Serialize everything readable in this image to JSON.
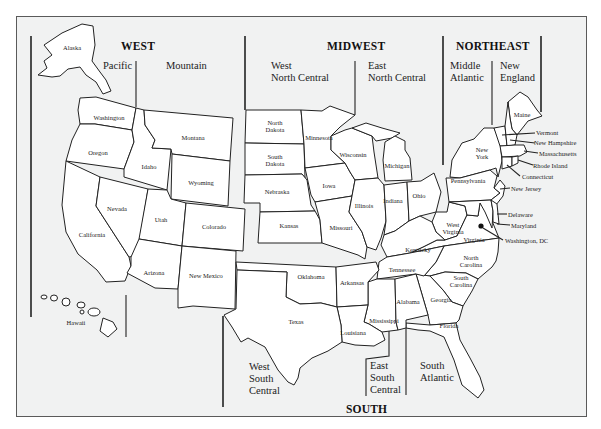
{
  "map": {
    "title": "US Census Regions and Divisions",
    "regions": {
      "west": "WEST",
      "midwest": "MIDWEST",
      "northeast": "NORTHEAST",
      "south": "SOUTH"
    },
    "divisions": {
      "pacific": "Pacific",
      "mountain": "Mountain",
      "west_north_central_1": "West",
      "west_north_central_2": "North Central",
      "east_north_central_1": "East",
      "east_north_central_2": "North Central",
      "middle_atlantic_1": "Middle",
      "middle_atlantic_2": "Atlantic",
      "new_england_1": "New",
      "new_england_2": "England",
      "west_south_central_1": "West",
      "west_south_central_2": "South",
      "west_south_central_3": "Central",
      "east_south_central_1": "East",
      "east_south_central_2": "South",
      "east_south_central_3": "Central",
      "south_atlantic_1": "South",
      "south_atlantic_2": "Atlantic"
    },
    "states": {
      "alaska": "Alaska",
      "hawaii": "Hawaii",
      "washington": "Washington",
      "oregon": "Oregon",
      "california": "California",
      "idaho": "Idaho",
      "montana": "Montana",
      "wyoming": "Wyoming",
      "nevada": "Nevada",
      "utah": "Utah",
      "colorado": "Colorado",
      "arizona": "Arizona",
      "new_mexico": "New Mexico",
      "north_dakota_1": "North",
      "north_dakota_2": "Dakota",
      "south_dakota_1": "South",
      "south_dakota_2": "Dakota",
      "nebraska": "Nebraska",
      "kansas": "Kansas",
      "minnesota": "Minnesota",
      "iowa": "Iowa",
      "missouri": "Missouri",
      "wisconsin": "Wisconsin",
      "illinois": "Illinois",
      "michigan": "Michigan",
      "indiana": "Indiana",
      "ohio": "Ohio",
      "new_york_1": "New",
      "new_york_2": "York",
      "pennsylvania": "Pennsylvania",
      "maine": "Maine",
      "oklahoma": "Oklahoma",
      "texas": "Texas",
      "arkansas": "Arkansas",
      "louisiana": "Louisiana",
      "kentucky": "Kentucky",
      "tennessee": "Tennessee",
      "mississippi": "Mississippi",
      "alabama": "Alabama",
      "georgia": "Georgia",
      "florida": "Florida",
      "west_virginia_1": "West",
      "west_virginia_2": "Virginia",
      "virginia": "Virginia",
      "north_carolina_1": "North",
      "north_carolina_2": "Carolina",
      "south_carolina_1": "South",
      "south_carolina_2": "Carolina"
    },
    "callouts": {
      "vermont": "Vermont",
      "new_hampshire": "New Hampshire",
      "massachusetts": "Massachusetts",
      "rhode_island": "Rhode Island",
      "connecticut": "Connecticut",
      "new_jersey": "New Jersey",
      "delaware": "Delaware",
      "maryland": "Maryland",
      "washington_dc": "Washington, DC"
    }
  }
}
